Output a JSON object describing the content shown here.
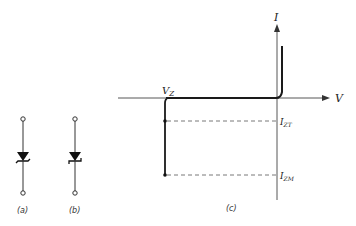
{
  "figure": {
    "symbols": [
      {
        "id": "a",
        "caption": "(a)",
        "description": "zener diode symbol, bent cathode bar"
      },
      {
        "id": "b",
        "caption": "(b)",
        "description": "zener diode symbol, hooked cathode bar"
      }
    ],
    "graph": {
      "caption": "(c)",
      "x_axis_label": "V",
      "y_axis_label": "I",
      "breakdown_voltage_label": "V",
      "breakdown_voltage_sub": "Z",
      "test_current_label": "I",
      "test_current_sub": "ZT",
      "max_current_label": "I",
      "max_current_sub": "ZM"
    },
    "colors": {
      "line": "#222222",
      "axis": "#444444",
      "dashed": "#555555"
    }
  }
}
